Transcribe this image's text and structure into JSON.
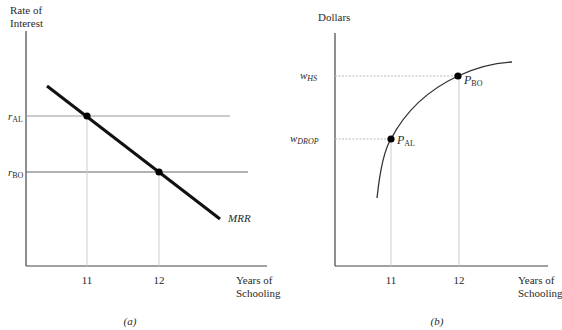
{
  "panel_a": {
    "caption": "(a)",
    "y_axis_title_line1": "Rate of",
    "y_axis_title_line2": "Interest",
    "x_axis_title_line1": "Years of",
    "x_axis_title_line2": "Schooling",
    "x_ticks": [
      "11",
      "12"
    ],
    "r_al": {
      "base": "r",
      "sub": "AL"
    },
    "r_bo": {
      "base": "r",
      "sub": "BO"
    },
    "curve_label": "MRR"
  },
  "panel_b": {
    "caption": "(b)",
    "y_axis_title": "Dollars",
    "x_axis_title_line1": "Years of",
    "x_axis_title_line2": "Schooling",
    "x_ticks": [
      "11",
      "12"
    ],
    "w_hs": {
      "base": "w",
      "sub": "HS"
    },
    "w_drop": {
      "base": "w",
      "sub": "DROP"
    },
    "p_al": {
      "base": "P",
      "sub": "AL"
    },
    "p_bo": {
      "base": "P",
      "sub": "BO"
    }
  },
  "colors": {
    "axis": "#444444",
    "curve": "#111111",
    "guide": "#bbbbbb",
    "hline": "#666666"
  }
}
